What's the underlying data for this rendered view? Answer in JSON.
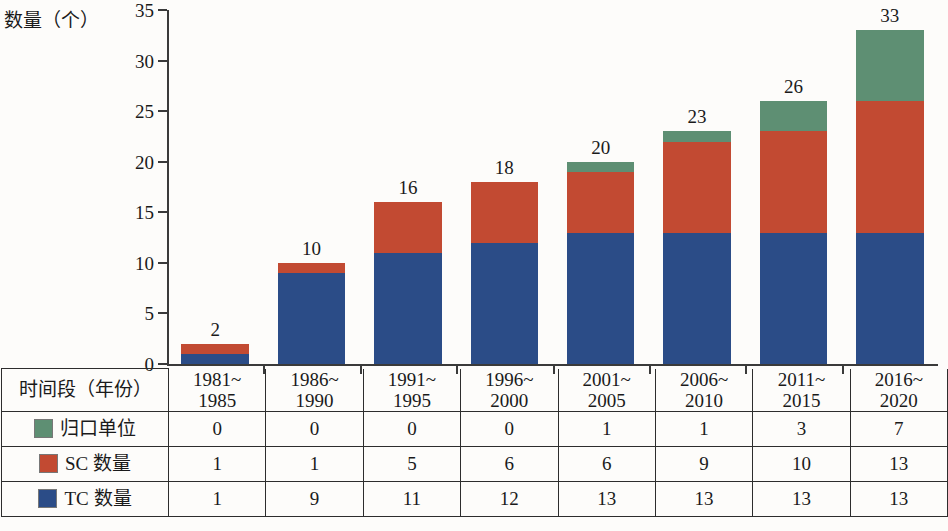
{
  "chart_data": {
    "type": "bar",
    "stacked": true,
    "title": "",
    "subtitle": "",
    "ylabel": "数量（个）",
    "xlabel": "时间段（年份）",
    "ylim": [
      0,
      35
    ],
    "ytick_values": [
      0,
      5,
      10,
      15,
      20,
      25,
      30,
      35
    ],
    "ytick_labels": [
      "0",
      "5",
      "10",
      "15",
      "20",
      "25",
      "30",
      "35"
    ],
    "grid": false,
    "legend_position": "table-row-labels",
    "categories": [
      "1981~1985",
      "1986~1990",
      "1991~1995",
      "1996~2000",
      "2001~2005",
      "2006~2010",
      "2011~2015",
      "2016~2020"
    ],
    "category_lines": [
      [
        "1981~",
        "1985"
      ],
      [
        "1986~",
        "1990"
      ],
      [
        "1991~",
        "1995"
      ],
      [
        "1996~",
        "2000"
      ],
      [
        "2001~",
        "2005"
      ],
      [
        "2006~",
        "2010"
      ],
      [
        "2011~",
        "2015"
      ],
      [
        "2016~",
        "2020"
      ]
    ],
    "series": [
      {
        "name": "TC 数量",
        "color": "#2b4c87",
        "values": [
          1,
          9,
          11,
          12,
          13,
          13,
          13,
          13
        ]
      },
      {
        "name": "SC 数量",
        "color": "#c24a32",
        "values": [
          1,
          1,
          5,
          6,
          6,
          9,
          10,
          13
        ]
      },
      {
        "name": "归口单位",
        "color": "#5e8f73",
        "values": [
          0,
          0,
          0,
          0,
          1,
          1,
          3,
          7
        ]
      }
    ],
    "totals": [
      2,
      10,
      16,
      18,
      20,
      23,
      26,
      33
    ],
    "total_labels": [
      "2",
      "10",
      "16",
      "18",
      "20",
      "23",
      "26",
      "33"
    ]
  },
  "table": {
    "corner_label": "时间段（年份）",
    "column_headers": [
      [
        "1981~",
        "1985"
      ],
      [
        "1986~",
        "1990"
      ],
      [
        "1991~",
        "1995"
      ],
      [
        "1996~",
        "2000"
      ],
      [
        "2001~",
        "2005"
      ],
      [
        "2006~",
        "2010"
      ],
      [
        "2011~",
        "2015"
      ],
      [
        "2016~",
        "2020"
      ]
    ],
    "rows": [
      {
        "label": "归口单位",
        "color": "#5e8f73",
        "values": [
          "0",
          "0",
          "0",
          "0",
          "1",
          "1",
          "3",
          "7"
        ]
      },
      {
        "label": "SC 数量",
        "color": "#c24a32",
        "values": [
          "1",
          "1",
          "5",
          "6",
          "6",
          "9",
          "10",
          "13"
        ]
      },
      {
        "label": "TC 数量",
        "color": "#2b4c87",
        "values": [
          "1",
          "9",
          "11",
          "12",
          "13",
          "13",
          "13",
          "13"
        ]
      }
    ]
  },
  "colors": {
    "green": "#5e8f73",
    "red": "#c24a32",
    "blue": "#2b4c87",
    "axis": "#3a3a3a",
    "background": "#fdfcfa"
  }
}
